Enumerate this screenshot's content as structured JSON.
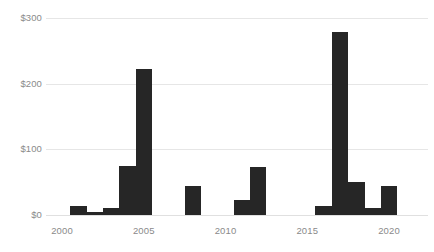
{
  "chart_data": {
    "type": "bar",
    "title": "",
    "subtitle": "",
    "xlabel": "",
    "ylabel": "",
    "xlim": [
      1999.2,
      2021.2
    ],
    "ylim": [
      0,
      300
    ],
    "grid": true,
    "legend": null,
    "bar_color": "#262626",
    "grid_color": "#e6e6e6",
    "tick_label_color": "#8a8a8a",
    "y_ticks": [
      0,
      100,
      200,
      300
    ],
    "y_tick_labels": [
      "$0",
      "$100",
      "$200",
      "$300"
    ],
    "x_ticks": [
      2000,
      2005,
      2010,
      2015,
      2020
    ],
    "x_tick_labels": [
      "2000",
      "2005",
      "2010",
      "2015",
      "2020"
    ],
    "categories": [
      2001,
      2002,
      2003,
      2004,
      2005,
      2008,
      2011,
      2012,
      2016,
      2017,
      2018,
      2019,
      2020
    ],
    "values": [
      14,
      4,
      11,
      75,
      222,
      44,
      23,
      73,
      14,
      278,
      50,
      11,
      44
    ]
  }
}
